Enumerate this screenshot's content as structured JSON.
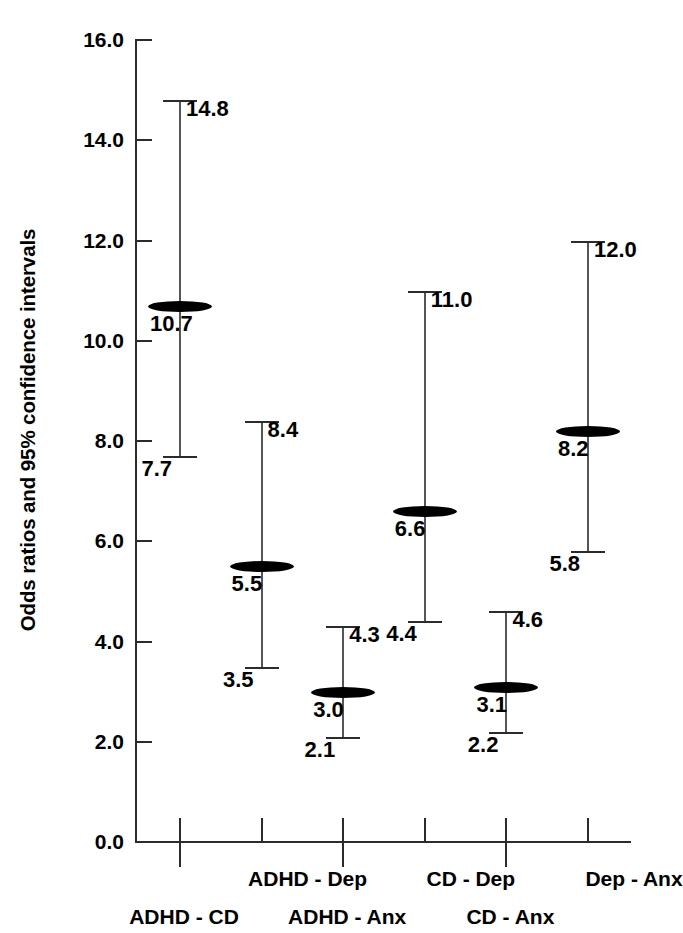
{
  "axes": {
    "y_title": "Odds ratios and 95% confidence intervals",
    "y_ticks": [
      "16.0",
      "14.0",
      "12.0",
      "10.0",
      "8.0",
      "6.0",
      "4.0",
      "2.0",
      "0.0"
    ]
  },
  "points": [
    {
      "category": "ADHD - CD",
      "estimate": "10.7",
      "lower": "7.7",
      "upper": "14.8"
    },
    {
      "category": "ADHD - Dep",
      "estimate": "5.5",
      "lower": "3.5",
      "upper": "8.4"
    },
    {
      "category": "ADHD - Anx",
      "estimate": "3.0",
      "lower": "2.1",
      "upper": "4.3"
    },
    {
      "category": "CD - Dep",
      "estimate": "6.6",
      "lower": "4.4",
      "upper": "11.0"
    },
    {
      "category": "CD - Anx",
      "estimate": "3.1",
      "lower": "2.2",
      "upper": "4.6"
    },
    {
      "category": "Dep - Anx",
      "estimate": "8.2",
      "lower": "5.8",
      "upper": "12.0"
    }
  ],
  "chart_data": {
    "type": "scatter",
    "title": "",
    "xlabel": "",
    "ylabel": "Odds ratios and 95% confidence intervals",
    "ylim": [
      0.0,
      16.0
    ],
    "ytick_step": 2.0,
    "grid": false,
    "legend": "none",
    "categories": [
      "ADHD - CD",
      "ADHD - Dep",
      "ADHD - Anx",
      "CD - Dep",
      "CD - Anx",
      "Dep - Anx"
    ],
    "values": [
      10.7,
      5.5,
      3.0,
      6.6,
      3.1,
      8.2
    ],
    "ci_lower": [
      7.7,
      3.5,
      2.1,
      4.4,
      2.2,
      5.8
    ],
    "ci_upper": [
      14.8,
      8.4,
      4.3,
      11.0,
      4.6,
      12.0
    ],
    "series": [
      {
        "name": "Odds ratio",
        "values": [
          10.7,
          5.5,
          3.0,
          6.6,
          3.1,
          8.2
        ]
      },
      {
        "name": "95% CI lower",
        "values": [
          7.7,
          3.5,
          2.1,
          4.4,
          2.2,
          5.8
        ]
      },
      {
        "name": "95% CI upper",
        "values": [
          14.8,
          8.4,
          4.3,
          11.0,
          4.6,
          12.0
        ]
      }
    ],
    "point_labels": [
      "10.7",
      "5.5",
      "3.0",
      "6.6",
      "3.1",
      "8.2"
    ],
    "colors": {
      "marker": "#000000",
      "ci_line": "#555555",
      "axis": "#2b2b2b",
      "background": "#ffffff"
    }
  }
}
